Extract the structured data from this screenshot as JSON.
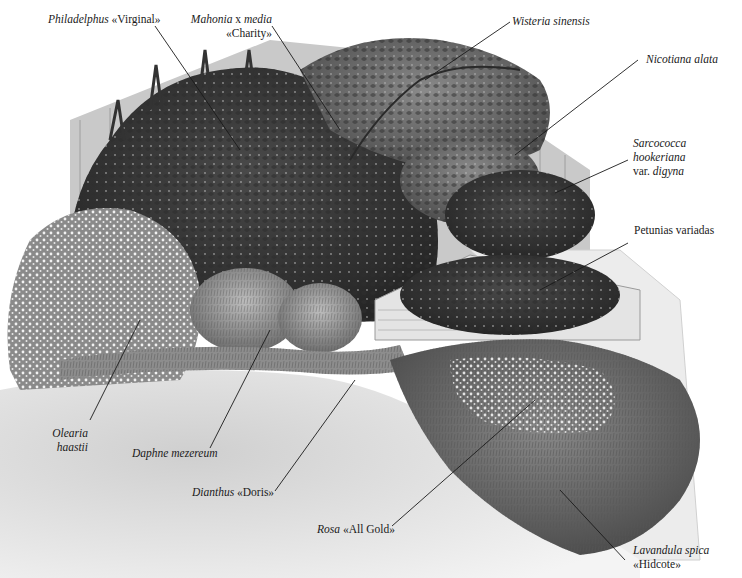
{
  "diagram": {
    "type": "illustrated garden plan",
    "labels": [
      {
        "id": "philadelphus",
        "italic": "Philadelphus",
        "plain": " «Virginal»",
        "line2_italic": "",
        "line2_plain": "",
        "line3": ""
      },
      {
        "id": "mahonia",
        "italic": "Mahonia",
        "plain": " x ",
        "italic2": "media",
        "line2_plain": "«Charity»"
      },
      {
        "id": "wisteria",
        "italic": "Wisteria sinensis"
      },
      {
        "id": "nicotiana",
        "italic": "Nicotiana alata"
      },
      {
        "id": "sarcococca",
        "line1": "Sarcococca",
        "line2": "hookeriana",
        "line3_plain": "var. ",
        "line3_italic": "digyna"
      },
      {
        "id": "petunias",
        "plain": "Petunias variadas"
      },
      {
        "id": "olearia",
        "line1": "Olearia",
        "line2": "haastii"
      },
      {
        "id": "daphne",
        "italic": "Daphne mezereum"
      },
      {
        "id": "dianthus",
        "italic": "Dianthus",
        "plain": " «Doris»"
      },
      {
        "id": "rosa",
        "italic": "Rosa",
        "plain": " «All Gold»"
      },
      {
        "id": "lavandula",
        "italic": "Lavandula spica",
        "line2_plain": "«Hidcote»"
      }
    ]
  },
  "colors": {
    "ink": "#1a1a1a",
    "foliage_dark": "#3a3a3a",
    "foliage_mid": "#6a6a6a",
    "foliage_light": "#9a9a9a",
    "lawn": "#d9d9d9",
    "fence": "#bdbdbd",
    "paving": "#e6e6e6",
    "background": "#ffffff"
  }
}
